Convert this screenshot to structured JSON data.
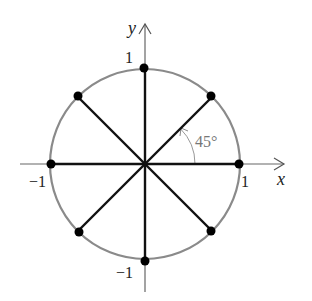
{
  "diagram": {
    "axes": {
      "x_label": "x",
      "y_label": "y"
    },
    "tick_labels": {
      "x_pos": "1",
      "x_neg": "−1",
      "y_pos": "1",
      "y_neg": "−1"
    },
    "angle_label": "45°",
    "circle": {
      "center": [
        0,
        0
      ],
      "radius": 1,
      "color": "#8a8a8a"
    },
    "spoke_color": "#111111",
    "points": [
      {
        "angle_deg": 0,
        "x": 1,
        "y": 0
      },
      {
        "angle_deg": 45,
        "x": 0.7071,
        "y": 0.7071
      },
      {
        "angle_deg": 90,
        "x": 0,
        "y": 1
      },
      {
        "angle_deg": 135,
        "x": -0.7071,
        "y": 0.7071
      },
      {
        "angle_deg": 180,
        "x": -1,
        "y": 0
      },
      {
        "angle_deg": 225,
        "x": -0.7071,
        "y": -0.7071
      },
      {
        "angle_deg": 270,
        "x": 0,
        "y": -1
      },
      {
        "angle_deg": 315,
        "x": 0.7071,
        "y": -0.7071
      }
    ]
  }
}
